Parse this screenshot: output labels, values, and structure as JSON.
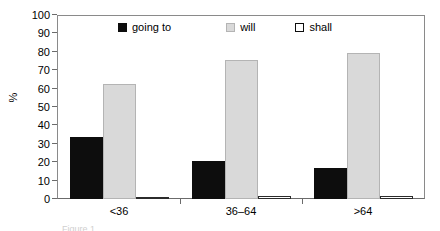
{
  "chart_data": {
    "type": "bar",
    "title": "",
    "subtitle": "",
    "xlabel": "",
    "ylabel": "%",
    "ylim": [
      0,
      100
    ],
    "y_ticks": [
      0,
      10,
      20,
      30,
      40,
      50,
      60,
      70,
      80,
      90,
      100
    ],
    "grid": false,
    "legend_position": "top-center-inside",
    "categories": [
      "<36",
      "36–64",
      ">64"
    ],
    "series": [
      {
        "name": "going to",
        "color": "#0d0d0d",
        "values": [
          34,
          21,
          17
        ]
      },
      {
        "name": "will",
        "color": "#d9d9d9",
        "values": [
          63,
          76,
          80
        ]
      },
      {
        "name": "shall",
        "color": "#ffffff",
        "values": [
          1,
          1.5,
          1.5
        ]
      }
    ]
  },
  "axis": {
    "y_title": "%",
    "y_tick_labels": [
      "100",
      "90",
      "80",
      "70",
      "60",
      "50",
      "40",
      "30",
      "20",
      "10",
      "0"
    ],
    "x_tick_labels": [
      "<36",
      "36–64",
      ">64"
    ]
  },
  "legend": {
    "entries": [
      {
        "label": "going to",
        "swatch": "filled-black-square"
      },
      {
        "label": "will",
        "swatch": "filled-gray-square"
      },
      {
        "label": "shall",
        "swatch": "outlined-white-square"
      }
    ]
  },
  "caption": {
    "text": "Figure 1"
  }
}
